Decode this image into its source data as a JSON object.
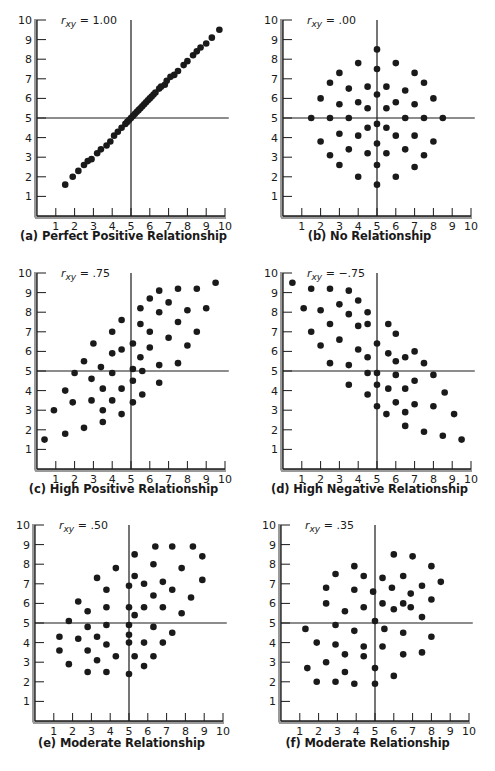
{
  "figure": {
    "panels": [
      {
        "id": "a",
        "caption": "(a) Perfect Positive Relationship",
        "r_label_main": "r",
        "r_label_sub": "xy",
        "r_value": " = 1.00"
      },
      {
        "id": "b",
        "caption": "(b) No Relationship",
        "r_label_main": "r",
        "r_label_sub": "xy",
        "r_value": " = .00"
      },
      {
        "id": "c",
        "caption": "(c) High Positive Relationship",
        "r_label_main": "r",
        "r_label_sub": "xy",
        "r_value": " = .75"
      },
      {
        "id": "d",
        "caption": "(d) High Negative Relationship",
        "r_label_main": "r",
        "r_label_sub": "xy",
        "r_value": " = −.75"
      },
      {
        "id": "e",
        "caption": "(e) Moderate Relationship",
        "r_label_main": "r",
        "r_label_sub": "xy",
        "r_value": " = .50"
      },
      {
        "id": "f",
        "caption": "(f) Moderate Relationship",
        "r_label_main": "r",
        "r_label_sub": "xy",
        "r_value": " = .35"
      }
    ],
    "tick_labels": [
      "1",
      "2",
      "3",
      "4",
      "5",
      "6",
      "7",
      "8",
      "9",
      "10"
    ],
    "colors": {
      "ink": "#1a1a1a",
      "axis": "#2a2a2a",
      "background": "#ffffff"
    }
  },
  "chart_data": [
    {
      "type": "scatter",
      "title": "(a) Perfect Positive Relationship",
      "annotation": "r_xy = 1.00",
      "xlabel": "",
      "ylabel": "",
      "xlim": [
        0,
        10
      ],
      "ylim": [
        0,
        10
      ],
      "xticks": [
        1,
        2,
        3,
        4,
        5,
        6,
        7,
        8,
        9,
        10
      ],
      "yticks": [
        1,
        2,
        3,
        4,
        5,
        6,
        7,
        8,
        9,
        10
      ],
      "reference_lines": {
        "x": 5,
        "y": 5
      },
      "grid": false,
      "points": [
        [
          1.5,
          1.6
        ],
        [
          1.9,
          2.0
        ],
        [
          2.2,
          2.3
        ],
        [
          2.5,
          2.6
        ],
        [
          2.7,
          2.8
        ],
        [
          2.9,
          2.9
        ],
        [
          3.2,
          3.2
        ],
        [
          3.4,
          3.4
        ],
        [
          3.7,
          3.6
        ],
        [
          3.9,
          3.8
        ],
        [
          4.1,
          4.1
        ],
        [
          4.3,
          4.3
        ],
        [
          4.5,
          4.5
        ],
        [
          4.7,
          4.7
        ],
        [
          4.8,
          4.8
        ],
        [
          4.9,
          4.9
        ],
        [
          5.0,
          5.0
        ],
        [
          5.1,
          5.1
        ],
        [
          5.2,
          5.2
        ],
        [
          5.3,
          5.3
        ],
        [
          5.4,
          5.4
        ],
        [
          5.5,
          5.5
        ],
        [
          5.6,
          5.6
        ],
        [
          5.7,
          5.7
        ],
        [
          5.8,
          5.8
        ],
        [
          5.9,
          5.9
        ],
        [
          6.0,
          6.0
        ],
        [
          6.1,
          6.1
        ],
        [
          6.2,
          6.2
        ],
        [
          6.3,
          6.3
        ],
        [
          6.5,
          6.5
        ],
        [
          6.6,
          6.6
        ],
        [
          6.8,
          6.7
        ],
        [
          6.9,
          6.9
        ],
        [
          7.1,
          7.1
        ],
        [
          7.3,
          7.2
        ],
        [
          7.5,
          7.4
        ],
        [
          7.8,
          7.7
        ],
        [
          8.0,
          7.9
        ],
        [
          8.3,
          8.2
        ],
        [
          8.5,
          8.4
        ],
        [
          8.7,
          8.6
        ],
        [
          9.0,
          8.8
        ],
        [
          9.3,
          9.1
        ],
        [
          9.7,
          9.5
        ]
      ]
    },
    {
      "type": "scatter",
      "title": "(b) No Relationship",
      "annotation": "r_xy = .00",
      "xlabel": "",
      "ylabel": "",
      "xlim": [
        0,
        10
      ],
      "ylim": [
        0,
        10
      ],
      "xticks": [
        1,
        2,
        3,
        4,
        5,
        6,
        7,
        8,
        9,
        10
      ],
      "yticks": [
        1,
        2,
        3,
        4,
        5,
        6,
        7,
        8,
        9,
        10
      ],
      "reference_lines": {
        "x": 5,
        "y": 5
      },
      "grid": false,
      "points": [
        [
          5.0,
          8.5
        ],
        [
          4.0,
          7.8
        ],
        [
          6.0,
          7.8
        ],
        [
          5.0,
          7.5
        ],
        [
          3.0,
          7.3
        ],
        [
          7.0,
          7.3
        ],
        [
          2.5,
          6.8
        ],
        [
          7.5,
          6.8
        ],
        [
          3.5,
          6.5
        ],
        [
          4.5,
          6.6
        ],
        [
          5.5,
          6.6
        ],
        [
          6.5,
          6.4
        ],
        [
          5.0,
          6.2
        ],
        [
          2.0,
          6.0
        ],
        [
          8.0,
          6.0
        ],
        [
          3.0,
          5.7
        ],
        [
          4.0,
          5.8
        ],
        [
          6.0,
          5.8
        ],
        [
          7.0,
          5.7
        ],
        [
          4.5,
          5.5
        ],
        [
          5.5,
          5.5
        ],
        [
          1.5,
          5.0
        ],
        [
          2.5,
          5.0
        ],
        [
          3.5,
          5.0
        ],
        [
          6.5,
          5.0
        ],
        [
          7.5,
          5.0
        ],
        [
          8.5,
          5.0
        ],
        [
          5.0,
          4.7
        ],
        [
          4.5,
          4.5
        ],
        [
          5.5,
          4.5
        ],
        [
          3.0,
          4.2
        ],
        [
          4.0,
          4.1
        ],
        [
          6.0,
          4.1
        ],
        [
          7.0,
          4.1
        ],
        [
          2.0,
          3.8
        ],
        [
          8.0,
          3.8
        ],
        [
          5.0,
          3.7
        ],
        [
          3.5,
          3.4
        ],
        [
          6.5,
          3.4
        ],
        [
          4.5,
          3.2
        ],
        [
          5.5,
          3.2
        ],
        [
          2.5,
          3.1
        ],
        [
          7.5,
          3.1
        ],
        [
          3.0,
          2.6
        ],
        [
          5.0,
          2.6
        ],
        [
          7.0,
          2.5
        ],
        [
          4.0,
          2.0
        ],
        [
          6.0,
          2.0
        ],
        [
          5.0,
          1.6
        ]
      ]
    },
    {
      "type": "scatter",
      "title": "(c) High Positive Relationship",
      "annotation": "r_xy = .75",
      "xlabel": "",
      "ylabel": "",
      "xlim": [
        0,
        10
      ],
      "ylim": [
        0,
        10
      ],
      "xticks": [
        1,
        2,
        3,
        4,
        5,
        6,
        7,
        8,
        9,
        10
      ],
      "yticks": [
        1,
        2,
        3,
        4,
        5,
        6,
        7,
        8,
        9,
        10
      ],
      "reference_lines": {
        "x": 5,
        "y": 5
      },
      "grid": false,
      "points": [
        [
          0.4,
          1.5
        ],
        [
          0.9,
          3.0
        ],
        [
          1.5,
          1.8
        ],
        [
          1.5,
          4.0
        ],
        [
          1.9,
          3.4
        ],
        [
          2.0,
          4.9
        ],
        [
          2.5,
          5.5
        ],
        [
          2.5,
          2.1
        ],
        [
          3.0,
          6.4
        ],
        [
          2.9,
          4.6
        ],
        [
          2.9,
          3.5
        ],
        [
          3.4,
          5.2
        ],
        [
          3.5,
          4.1
        ],
        [
          3.5,
          3.0
        ],
        [
          3.5,
          2.4
        ],
        [
          4.0,
          7.0
        ],
        [
          4.0,
          5.9
        ],
        [
          4.0,
          4.9
        ],
        [
          4.0,
          3.5
        ],
        [
          4.5,
          7.6
        ],
        [
          4.5,
          6.1
        ],
        [
          4.5,
          4.1
        ],
        [
          4.5,
          2.8
        ],
        [
          5.1,
          6.4
        ],
        [
          5.1,
          5.1
        ],
        [
          5.1,
          4.5
        ],
        [
          5.1,
          3.4
        ],
        [
          5.5,
          8.2
        ],
        [
          5.5,
          7.4
        ],
        [
          5.5,
          5.7
        ],
        [
          5.6,
          5.0
        ],
        [
          5.6,
          3.8
        ],
        [
          6.0,
          8.7
        ],
        [
          6.0,
          7.0
        ],
        [
          6.0,
          6.2
        ],
        [
          6.5,
          9.1
        ],
        [
          6.5,
          8.0
        ],
        [
          6.5,
          5.3
        ],
        [
          6.5,
          4.4
        ],
        [
          7.0,
          8.5
        ],
        [
          7.0,
          6.7
        ],
        [
          7.5,
          9.2
        ],
        [
          7.5,
          7.5
        ],
        [
          7.5,
          5.4
        ],
        [
          8.0,
          8.1
        ],
        [
          8.0,
          6.3
        ],
        [
          8.5,
          9.2
        ],
        [
          8.5,
          7.0
        ],
        [
          9.0,
          8.2
        ],
        [
          9.5,
          9.5
        ]
      ]
    },
    {
      "type": "scatter",
      "title": "(d) High Negative Relationship",
      "annotation": "r_xy = -.75",
      "xlabel": "",
      "ylabel": "",
      "xlim": [
        0,
        10
      ],
      "ylim": [
        0,
        10
      ],
      "xticks": [
        1,
        2,
        3,
        4,
        5,
        6,
        7,
        8,
        9,
        10
      ],
      "yticks": [
        1,
        2,
        3,
        4,
        5,
        6,
        7,
        8,
        9,
        10
      ],
      "reference_lines": {
        "x": 5,
        "y": 5
      },
      "grid": false,
      "points": [
        [
          0.5,
          9.5
        ],
        [
          1.1,
          8.2
        ],
        [
          1.5,
          9.2
        ],
        [
          1.5,
          7.0
        ],
        [
          2.0,
          8.1
        ],
        [
          2.0,
          6.3
        ],
        [
          2.5,
          9.2
        ],
        [
          2.5,
          7.4
        ],
        [
          2.5,
          5.4
        ],
        [
          3.0,
          8.4
        ],
        [
          3.0,
          6.6
        ],
        [
          3.5,
          9.1
        ],
        [
          3.5,
          7.9
        ],
        [
          3.5,
          5.3
        ],
        [
          3.5,
          4.3
        ],
        [
          4.0,
          8.6
        ],
        [
          4.0,
          7.3
        ],
        [
          4.0,
          6.1
        ],
        [
          4.5,
          8.0
        ],
        [
          4.5,
          7.4
        ],
        [
          4.5,
          5.7
        ],
        [
          4.5,
          4.9
        ],
        [
          4.5,
          3.8
        ],
        [
          5.0,
          6.4
        ],
        [
          5.0,
          4.9
        ],
        [
          5.0,
          4.3
        ],
        [
          5.0,
          3.2
        ],
        [
          5.5,
          2.8
        ],
        [
          5.6,
          7.4
        ],
        [
          5.6,
          5.9
        ],
        [
          5.6,
          4.1
        ],
        [
          6.0,
          6.9
        ],
        [
          6.0,
          5.5
        ],
        [
          6.0,
          4.8
        ],
        [
          6.0,
          3.4
        ],
        [
          6.5,
          5.7
        ],
        [
          6.5,
          4.1
        ],
        [
          6.5,
          2.9
        ],
        [
          6.5,
          2.2
        ],
        [
          7.0,
          6.0
        ],
        [
          7.0,
          4.5
        ],
        [
          7.0,
          3.3
        ],
        [
          7.5,
          5.4
        ],
        [
          7.5,
          1.9
        ],
        [
          8.0,
          4.8
        ],
        [
          8.0,
          3.2
        ],
        [
          8.5,
          1.7
        ],
        [
          8.6,
          3.9
        ],
        [
          9.1,
          2.8
        ],
        [
          9.5,
          1.5
        ]
      ]
    },
    {
      "type": "scatter",
      "title": "(e) Moderate Relationship",
      "annotation": "r_xy = .50",
      "xlabel": "",
      "ylabel": "",
      "xlim": [
        0,
        10
      ],
      "ylim": [
        0,
        10
      ],
      "xticks": [
        1,
        2,
        3,
        4,
        5,
        6,
        7,
        8,
        9,
        10
      ],
      "yticks": [
        1,
        2,
        3,
        4,
        5,
        6,
        7,
        8,
        9,
        10
      ],
      "reference_lines": {
        "x": 5,
        "y": 5
      },
      "grid": false,
      "points": [
        [
          1.3,
          4.3
        ],
        [
          1.3,
          3.6
        ],
        [
          1.8,
          5.1
        ],
        [
          1.8,
          2.9
        ],
        [
          2.3,
          6.1
        ],
        [
          2.3,
          4.2
        ],
        [
          2.8,
          5.6
        ],
        [
          2.8,
          4.8
        ],
        [
          2.8,
          3.6
        ],
        [
          2.8,
          2.5
        ],
        [
          3.3,
          7.3
        ],
        [
          3.3,
          4.3
        ],
        [
          3.3,
          3.1
        ],
        [
          3.8,
          6.7
        ],
        [
          3.8,
          5.8
        ],
        [
          3.8,
          4.9
        ],
        [
          3.8,
          3.9
        ],
        [
          3.8,
          2.5
        ],
        [
          4.3,
          7.8
        ],
        [
          4.3,
          3.3
        ],
        [
          5.0,
          6.9
        ],
        [
          5.0,
          5.8
        ],
        [
          5.0,
          4.9
        ],
        [
          5.0,
          4.4
        ],
        [
          5.0,
          4.0
        ],
        [
          5.0,
          2.4
        ],
        [
          5.3,
          8.5
        ],
        [
          5.3,
          7.4
        ],
        [
          5.3,
          5.4
        ],
        [
          5.3,
          3.3
        ],
        [
          5.8,
          7.0
        ],
        [
          5.8,
          5.8
        ],
        [
          5.8,
          4.0
        ],
        [
          5.8,
          2.8
        ],
        [
          6.3,
          8.0
        ],
        [
          6.3,
          6.4
        ],
        [
          6.3,
          4.8
        ],
        [
          6.3,
          3.3
        ],
        [
          6.4,
          8.9
        ],
        [
          6.8,
          7.1
        ],
        [
          6.8,
          5.8
        ],
        [
          6.8,
          4.0
        ],
        [
          7.3,
          8.9
        ],
        [
          7.3,
          6.7
        ],
        [
          7.3,
          4.5
        ],
        [
          7.8,
          7.8
        ],
        [
          7.8,
          5.5
        ],
        [
          8.3,
          6.3
        ],
        [
          8.4,
          8.9
        ],
        [
          8.9,
          8.4
        ],
        [
          8.9,
          7.2
        ]
      ]
    },
    {
      "type": "scatter",
      "title": "(f) Moderate Relationship",
      "annotation": "r_xy = .35",
      "xlabel": "",
      "ylabel": "",
      "xlim": [
        0,
        10
      ],
      "ylim": [
        0,
        10
      ],
      "xticks": [
        1,
        2,
        3,
        4,
        5,
        6,
        7,
        8,
        9,
        10
      ],
      "yticks": [
        1,
        2,
        3,
        4,
        5,
        6,
        7,
        8,
        9,
        10
      ],
      "reference_lines": {
        "x": 5,
        "y": 5
      },
      "grid": false,
      "points": [
        [
          1.3,
          4.7
        ],
        [
          1.4,
          2.7
        ],
        [
          1.9,
          4.0
        ],
        [
          1.9,
          2.0
        ],
        [
          2.4,
          6.8
        ],
        [
          2.4,
          6.0
        ],
        [
          2.4,
          3.0
        ],
        [
          2.9,
          7.5
        ],
        [
          2.9,
          4.9
        ],
        [
          2.9,
          3.9
        ],
        [
          2.9,
          2.0
        ],
        [
          3.4,
          5.6
        ],
        [
          3.4,
          3.4
        ],
        [
          3.4,
          2.5
        ],
        [
          3.9,
          7.9
        ],
        [
          3.9,
          6.7
        ],
        [
          3.9,
          4.6
        ],
        [
          3.9,
          1.9
        ],
        [
          4.4,
          7.4
        ],
        [
          4.4,
          5.8
        ],
        [
          4.4,
          3.8
        ],
        [
          4.4,
          3.3
        ],
        [
          4.9,
          6.6
        ],
        [
          5.0,
          5.1
        ],
        [
          5.0,
          2.7
        ],
        [
          5.0,
          1.9
        ],
        [
          5.4,
          7.3
        ],
        [
          5.4,
          6.0
        ],
        [
          5.5,
          4.7
        ],
        [
          5.4,
          3.8
        ],
        [
          5.9,
          6.8
        ],
        [
          6.0,
          5.7
        ],
        [
          6.0,
          8.5
        ],
        [
          6.0,
          2.3
        ],
        [
          6.5,
          7.4
        ],
        [
          6.5,
          6.0
        ],
        [
          6.5,
          4.5
        ],
        [
          6.5,
          3.4
        ],
        [
          6.9,
          6.5
        ],
        [
          6.9,
          5.8
        ],
        [
          7.0,
          8.4
        ],
        [
          7.5,
          6.9
        ],
        [
          7.5,
          5.3
        ],
        [
          7.5,
          3.5
        ],
        [
          8.0,
          7.9
        ],
        [
          8.0,
          6.2
        ],
        [
          8.0,
          4.3
        ],
        [
          8.5,
          7.1
        ]
      ]
    }
  ]
}
